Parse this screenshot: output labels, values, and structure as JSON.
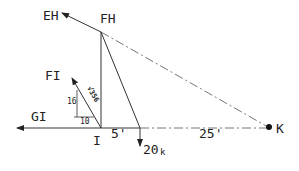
{
  "diagram": {
    "type": "free-body / truss joint diagram",
    "colors": {
      "line": "#333333",
      "dash": "#777777",
      "text": "#222222"
    },
    "labels": {
      "eh": "EH",
      "fh": "FH",
      "fi": "FI",
      "gi": "GI",
      "i": "I",
      "k": "K",
      "dist_5": "5'",
      "dist_25": "25'",
      "load": "20",
      "load_unit": "k",
      "slope_rise": "16",
      "slope_run": "10",
      "slope_hyp": "√356"
    }
  }
}
